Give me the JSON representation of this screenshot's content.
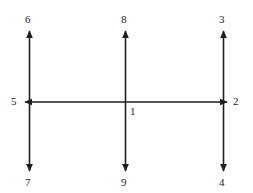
{
  "diagram": {
    "type": "arrow-axes-diagram",
    "canvas": {
      "width": 253,
      "height": 193,
      "background": "#ffffff"
    },
    "stroke": {
      "color": "#1f1f1f",
      "width": 1.6,
      "arrowhead": "solid-triangle"
    },
    "geometry": {
      "horizontal_axis": {
        "y": 102,
        "x_start": 24,
        "x_end": 228,
        "arrows": "both"
      },
      "vertical_axes": [
        {
          "name": "left",
          "x": 29,
          "y_top": 30,
          "y_bottom": 172,
          "arrows": "both"
        },
        {
          "name": "center",
          "x": 125,
          "y_top": 30,
          "y_bottom": 172,
          "arrows": "both"
        },
        {
          "name": "right",
          "x": 223,
          "y_top": 30,
          "y_bottom": 172,
          "arrows": "both"
        }
      ],
      "intersections": [
        {
          "name": "left-node",
          "x": 29,
          "y": 102
        },
        {
          "name": "center-node",
          "x": 125,
          "y": 102
        },
        {
          "name": "right-node",
          "x": 223,
          "y": 102
        }
      ]
    },
    "labels": [
      {
        "id": "label-6",
        "text": "6",
        "x": 25,
        "y": 13,
        "anchor": "top-left-axis-tip"
      },
      {
        "id": "label-8",
        "text": "8",
        "x": 121,
        "y": 13,
        "anchor": "top-center-axis-tip"
      },
      {
        "id": "label-3",
        "text": "3",
        "x": 219,
        "y": 13,
        "anchor": "top-right-axis-tip"
      },
      {
        "id": "label-5",
        "text": "5",
        "x": 11,
        "y": 95,
        "anchor": "left-horizontal-tip"
      },
      {
        "id": "label-1",
        "text": "1",
        "x": 130,
        "y": 105,
        "anchor": "center-intersection"
      },
      {
        "id": "label-2",
        "text": "2",
        "x": 233,
        "y": 95,
        "anchor": "right-horizontal-tip"
      },
      {
        "id": "label-7",
        "text": "7",
        "x": 25,
        "y": 176,
        "anchor": "bottom-left-axis-tip"
      },
      {
        "id": "label-9",
        "text": "9",
        "x": 121,
        "y": 176,
        "anchor": "bottom-center-axis-tip"
      },
      {
        "id": "label-4",
        "text": "4",
        "x": 219,
        "y": 176,
        "anchor": "bottom-right-axis-tip"
      }
    ]
  }
}
